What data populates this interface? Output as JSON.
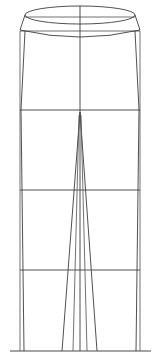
{
  "image": {
    "title": "Technical flat line drawing of trousers",
    "subject": "trousers",
    "view": "front",
    "style": "line-art",
    "width": 161,
    "height": 363
  },
  "colors": {
    "background": "#ffffff",
    "line": "#3c3c3c",
    "line_light": "#585858",
    "ground": "#4a4a4a"
  },
  "chart_data": {
    "type": "line",
    "xlabel": "",
    "ylabel": "",
    "xlim": [
      0,
      161
    ],
    "ylim": [
      0,
      363
    ],
    "grid": false,
    "legend_position": "none",
    "series": [
      {
        "name": "waistband-top-ellipse",
        "part": "waistband",
        "closed": true,
        "x": [
          25,
          40,
          60,
          80,
          100,
          120,
          135,
          120,
          100,
          80,
          60,
          40,
          25
        ],
        "y": [
          15,
          10,
          7,
          6,
          7,
          10,
          15,
          20,
          23,
          24,
          23,
          20,
          15
        ]
      },
      {
        "name": "waistband-bottom-arc",
        "part": "waistband",
        "closed": false,
        "x": [
          20,
          40,
          60,
          80,
          100,
          120,
          140
        ],
        "y": [
          30,
          34,
          36,
          37,
          36,
          34,
          30
        ]
      },
      {
        "name": "waistband-left-edge",
        "part": "waistband",
        "closed": false,
        "x": [
          25,
          20
        ],
        "y": [
          15,
          30
        ]
      },
      {
        "name": "waistband-right-edge",
        "part": "waistband",
        "closed": false,
        "x": [
          135,
          140
        ],
        "y": [
          15,
          30
        ]
      },
      {
        "name": "waist-construction-top",
        "part": "construction",
        "closed": false,
        "x": [
          25,
          135
        ],
        "y": [
          17,
          17
        ]
      },
      {
        "name": "waist-construction-bottom",
        "part": "construction",
        "closed": false,
        "x": [
          20,
          140
        ],
        "y": [
          31,
          31
        ]
      },
      {
        "name": "left-hip-seam",
        "part": "side-seam",
        "closed": false,
        "x": [
          25,
          21
        ],
        "y": [
          31,
          110
        ]
      },
      {
        "name": "right-hip-seam",
        "part": "side-seam",
        "closed": false,
        "x": [
          135,
          139
        ],
        "y": [
          31,
          110
        ]
      },
      {
        "name": "left-outer-vertical",
        "part": "construction",
        "closed": false,
        "x": [
          20,
          20
        ],
        "y": [
          31,
          351
        ]
      },
      {
        "name": "right-outer-vertical",
        "part": "construction",
        "closed": false,
        "x": [
          140,
          140
        ],
        "y": [
          31,
          351
        ]
      },
      {
        "name": "left-side-seam-lower",
        "part": "side-seam",
        "closed": false,
        "x": [
          21,
          24
        ],
        "y": [
          110,
          351
        ]
      },
      {
        "name": "right-side-seam-lower",
        "part": "side-seam",
        "closed": false,
        "x": [
          139,
          136
        ],
        "y": [
          110,
          351
        ]
      },
      {
        "name": "hip-line",
        "part": "horizontal-guide",
        "closed": false,
        "x": [
          20,
          140
        ],
        "y": [
          110,
          110
        ]
      },
      {
        "name": "knee-line",
        "part": "horizontal-guide",
        "closed": false,
        "x": [
          20,
          140
        ],
        "y": [
          190,
          190
        ]
      },
      {
        "name": "calf-line",
        "part": "horizontal-guide",
        "closed": false,
        "x": [
          20,
          140
        ],
        "y": [
          270,
          270
        ]
      },
      {
        "name": "center-front-crease",
        "part": "crease",
        "closed": false,
        "x": [
          80,
          80
        ],
        "y": [
          6,
          351
        ]
      },
      {
        "name": "left-inseam",
        "part": "inseam",
        "closed": false,
        "x": [
          80,
          62
        ],
        "y": [
          112,
          351
        ]
      },
      {
        "name": "right-inseam",
        "part": "inseam",
        "closed": false,
        "x": [
          80,
          97
        ],
        "y": [
          112,
          351
        ]
      },
      {
        "name": "left-inner-leg-edge",
        "part": "inseam",
        "closed": false,
        "x": [
          79,
          73
        ],
        "y": [
          115,
          351
        ]
      },
      {
        "name": "right-inner-leg-edge",
        "part": "inseam",
        "closed": false,
        "x": [
          81,
          87
        ],
        "y": [
          115,
          351
        ]
      },
      {
        "name": "ground-line",
        "part": "baseline",
        "closed": false,
        "x": [
          10,
          151
        ],
        "y": [
          351,
          351
        ]
      }
    ],
    "annotations": []
  },
  "parts": {
    "waistband": "waistband",
    "hip_line": "hip line",
    "knee_line": "knee line",
    "calf_line": "calf line",
    "center_crease": "center front crease",
    "inseam": "inseam",
    "side_seam": "side seam",
    "ground_line": "ground line"
  }
}
